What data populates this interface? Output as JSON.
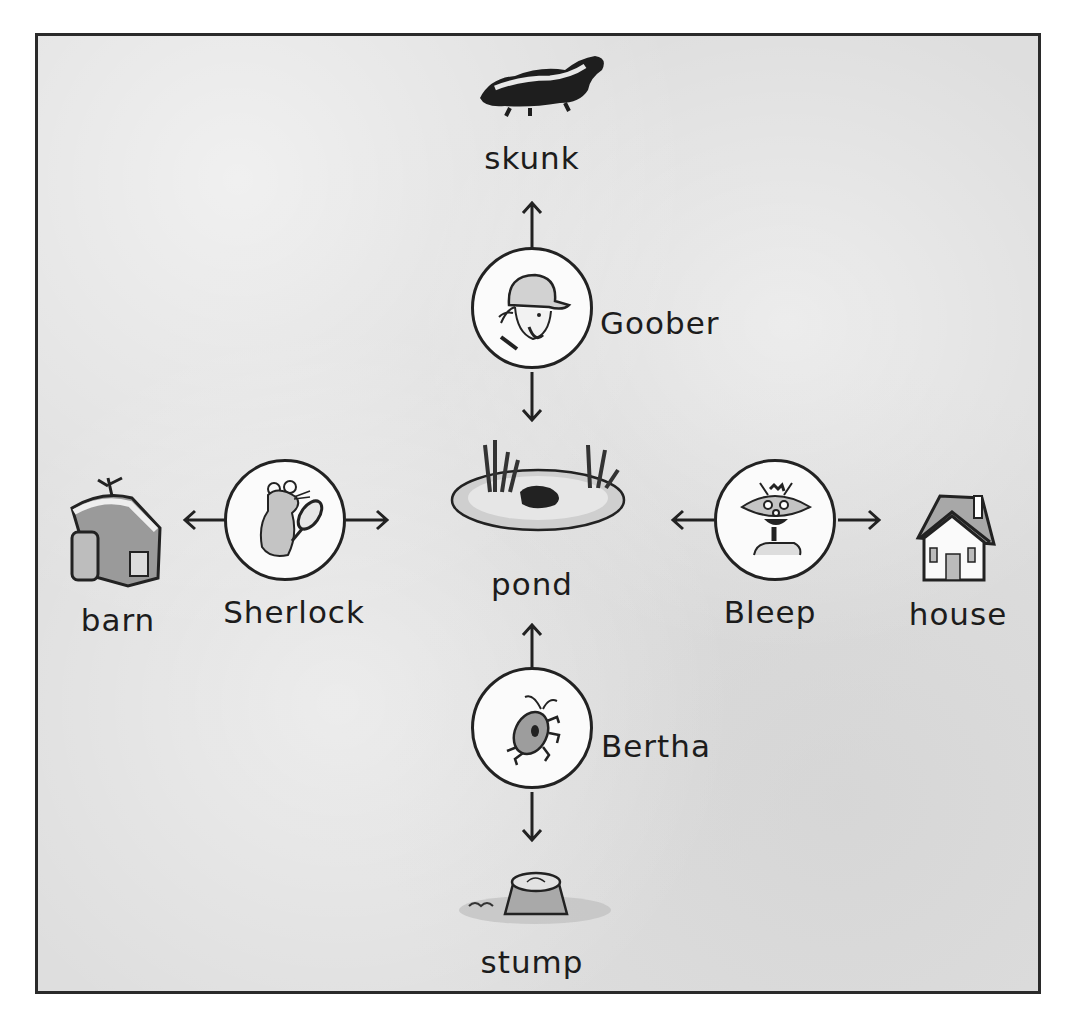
{
  "diagram": {
    "places": {
      "skunk": {
        "label": "skunk",
        "icon": "skunk-icon"
      },
      "pond": {
        "label": "pond",
        "icon": "pond-icon"
      },
      "barn": {
        "label": "barn",
        "icon": "barn-icon"
      },
      "house": {
        "label": "house",
        "icon": "house-icon"
      },
      "stump": {
        "label": "stump",
        "icon": "stump-icon"
      }
    },
    "characters": {
      "goober": {
        "label": "Goober",
        "icon": "farmer-face-icon",
        "arrows": [
          "skunk",
          "pond"
        ]
      },
      "sherlock": {
        "label": "Sherlock",
        "icon": "mouse-detective-icon",
        "arrows": [
          "barn",
          "pond"
        ]
      },
      "bleep": {
        "label": "Bleep",
        "icon": "robot-alien-icon",
        "arrows": [
          "pond",
          "house"
        ]
      },
      "bertha": {
        "label": "Bertha",
        "icon": "bug-icon",
        "arrows": [
          "pond",
          "stump"
        ]
      }
    },
    "colors": {
      "ink": "#222222",
      "background": "#dedede",
      "circle_fill": "#fbfbfb"
    }
  }
}
